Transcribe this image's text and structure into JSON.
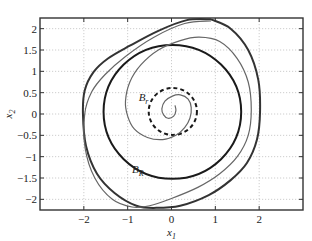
{
  "chart_data": {
    "type": "line",
    "title": "",
    "xlabel": "x1",
    "ylabel": "x2",
    "xlim": [
      -3,
      3
    ],
    "ylim": [
      -2.25,
      2.25
    ],
    "grid": true,
    "legend": "none",
    "xticks": [
      -2,
      -1,
      0,
      1,
      2
    ],
    "xtick_labels": [
      "−2",
      "−1",
      "0",
      "1",
      "2"
    ],
    "yticks": [
      2,
      1.5,
      1,
      0.5,
      0,
      -0.5,
      -1,
      -1.5,
      -2
    ],
    "ytick_labels": [
      "2",
      "1.5",
      "1",
      "0.5",
      "0",
      "−0.5",
      "−1",
      "−1.5",
      "−2"
    ],
    "annotations": [
      {
        "base": "B",
        "sub": "r",
        "x": -0.75,
        "y": 0.3
      },
      {
        "base": "B",
        "sub": "R",
        "x": -0.9,
        "y": -1.38
      }
    ],
    "series": [
      {
        "name": "B_R circle",
        "style": "thick-solid",
        "color": "#1a1a1a",
        "shape": "circle",
        "center": [
          0.02,
          0.05
        ],
        "radius": 1.57
      },
      {
        "name": "B_r circle",
        "style": "dashed",
        "color": "#1a1a1a",
        "shape": "circle",
        "center": [
          0.03,
          0.06
        ],
        "radius": 0.55
      },
      {
        "name": "outer trajectory",
        "style": "thick-solid",
        "color": "#333333",
        "x": [
          0.9,
          1.35,
          1.75,
          1.98,
          2.02,
          1.95,
          1.72,
          1.35,
          0.85,
          0.2,
          -0.35,
          -0.8,
          -1.3,
          -1.7,
          -1.95,
          -2.02,
          -1.98,
          -1.78,
          -1.45,
          -0.95,
          -0.3,
          0.35,
          0.9
        ],
        "y": [
          2.22,
          2.0,
          1.5,
          0.8,
          0.05,
          -0.6,
          -1.15,
          -1.55,
          -1.9,
          -2.15,
          -2.2,
          -2.15,
          -1.85,
          -1.4,
          -0.75,
          0.0,
          0.55,
          0.98,
          1.3,
          1.6,
          1.95,
          2.2,
          2.22
        ]
      },
      {
        "name": "spiral trajectory",
        "style": "thin-solid",
        "color": "#666666",
        "x": [
          0.08,
          0.1,
          0.05,
          -0.08,
          -0.18,
          -0.22,
          -0.15,
          0.02,
          0.2,
          0.38,
          0.45,
          0.42,
          0.3,
          0.1,
          -0.2,
          -0.55,
          -0.85,
          -1.0,
          -1.05,
          -0.95,
          -0.7,
          -0.3,
          0.2,
          0.63,
          1.1,
          1.5,
          1.75,
          1.82,
          1.75,
          1.5,
          1.1,
          0.6,
          0.0,
          -0.5,
          -0.9,
          -1.35,
          -1.75,
          -1.97,
          -1.98,
          -1.82,
          -1.52,
          -1.05,
          -0.4,
          0.3,
          0.9
        ],
        "y": [
          0.2,
          0.08,
          -0.05,
          -0.1,
          -0.02,
          0.12,
          0.3,
          0.42,
          0.45,
          0.35,
          0.15,
          -0.1,
          -0.32,
          -0.5,
          -0.6,
          -0.55,
          -0.35,
          -0.05,
          0.3,
          0.75,
          1.15,
          1.5,
          1.72,
          1.8,
          1.7,
          1.3,
          0.75,
          0.1,
          -0.5,
          -1.0,
          -1.4,
          -1.72,
          -1.98,
          -2.15,
          -2.18,
          -2.0,
          -1.5,
          -0.8,
          0.0,
          0.52,
          0.92,
          1.35,
          1.8,
          2.12,
          2.18
        ]
      }
    ]
  }
}
